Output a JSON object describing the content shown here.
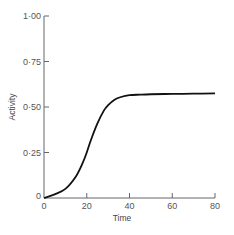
{
  "chart_data": {
    "type": "line",
    "title": "",
    "xlabel": "Time",
    "ylabel": "Activity",
    "xlim": [
      0,
      80
    ],
    "ylim": [
      0,
      1.0
    ],
    "grid": false,
    "legend": null,
    "x_ticks": [
      "0",
      "20",
      "40",
      "60",
      "80"
    ],
    "y_ticks": [
      "0",
      "0·25",
      "0·50",
      "0·75",
      "1·00"
    ],
    "series": [
      {
        "name": "Activity",
        "x": [
          0,
          5,
          10,
          15,
          18,
          20,
          22,
          25,
          28,
          30,
          33,
          36,
          40,
          45,
          50,
          60,
          70,
          80
        ],
        "values": [
          0.0,
          0.02,
          0.05,
          0.12,
          0.19,
          0.25,
          0.32,
          0.41,
          0.48,
          0.51,
          0.54,
          0.555,
          0.565,
          0.568,
          0.57,
          0.572,
          0.573,
          0.575
        ]
      }
    ]
  }
}
